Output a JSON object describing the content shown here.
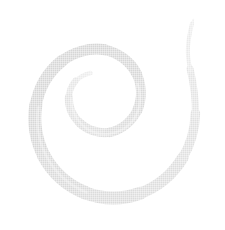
{
  "image": {
    "title": "Spiral",
    "alt_text": "Light gray spiral swirl on white background",
    "width": 225,
    "height": 230,
    "background_color": "#ffffff"
  },
  "graphic": {
    "name": "spiral-swirl",
    "shape_type": "archimedean-spiral",
    "winding_direction": "counterclockwise",
    "turns": 1.75,
    "stroke_color_light": "#e7e7e7",
    "stroke_color_mid": "#dcdcdc",
    "stroke_color_dark": "#d2d2d2",
    "texture": "halftone-dither",
    "center_x": 98,
    "center_y": 108,
    "inner_tip_x": 90,
    "inner_tip_y": 73,
    "outer_tip_x": 193,
    "outer_tip_y": 20,
    "inner_radius": 25,
    "outer_radius": 86,
    "max_band_width": 14,
    "min_band_width": 1,
    "path": "M 90.0 73.2 C 78.4 76.3 70.6 85.4 69.2 96.3 C 67.4 110.3 74.6 124.6 87.3 131.9 C 101.4 140.1 120.1 137.8 132.0 127.2 C 144.8 115.9 148.6 96.5 142.3 80.8 C 135.6 63.9 118.5 52.2 100.6 50.3 C 81.2 48.2 61.3 56.2 48.1 70.3 C 33.8 85.6 27.0 107.2 28.8 127.9 C 30.7 150.0 42.2 170.9 59.6 184.7 C 78.2 199.5 102.9 205.4 126.2 201.5 C 150.9 197.4 173.2 183.0 187.0 162.2 C 193.3 152.7 197.5 142.3 200.3 131.6",
    "path_outline": "M 90.4 74.6 C 79.4 77.6 72.1 86.1 70.8 96.4 C 69.1 109.6 75.9 123.1 87.9 130.0 C 101.1 137.6 118.6 135.5 129.8 125.6 C 141.8 115.0 145.3 96.7 139.4 82.0 C 133.1 66.2 117.0 55.3 100.2 53.5 C 82.0 51.5 63.3 59.1 50.9 72.4 C 37.5 86.8 31.1 107.1 32.8 126.5 C 34.6 147.3 45.4 166.9 61.7 179.8 C 79.1 193.6 102.3 199.1 124.1 195.5 C 147.2 191.6 168.1 178.1 181.0 158.7"
  },
  "legend": {
    "caption": ""
  }
}
